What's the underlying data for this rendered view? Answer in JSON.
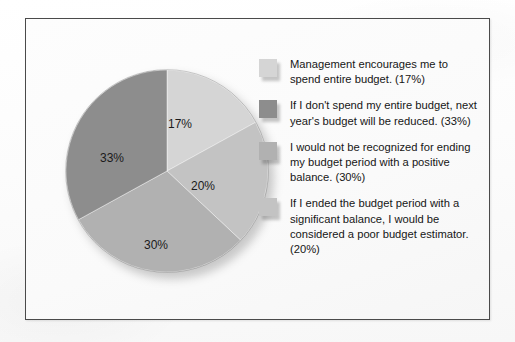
{
  "chart_data": {
    "type": "pie",
    "title": "",
    "subtitle": "",
    "xlabel": "",
    "ylabel": "",
    "legend_position": "right",
    "grid": false,
    "start_angle_deg": 0,
    "direction": "clockwise",
    "categories": [
      "Management encourages me to spend entire budget.",
      "If I don't spend my entire budget, next year's budget will be reduced.",
      "I would not be recognized for ending my budget period with a positive balance.",
      "If I ended the budget period with a significant balance, I would be considered a poor budget estimator."
    ],
    "values": [
      17,
      33,
      30,
      20
    ],
    "value_unit": "%",
    "slices": [
      {
        "label": "17%",
        "value": 17,
        "color": "#d5d5d5",
        "legend_index": 0,
        "start_angle_deg": 0,
        "end_angle_deg": 61.2,
        "label_x": 103,
        "label_y": 48
      },
      {
        "label": "20%",
        "value": 20,
        "color": "#c3c3c3",
        "legend_index": 3,
        "start_angle_deg": 61.2,
        "end_angle_deg": 133.2,
        "label_x": 126,
        "label_y": 110
      },
      {
        "label": "30%",
        "value": 30,
        "color": "#b1b1b1",
        "legend_index": 2,
        "start_angle_deg": 133.2,
        "end_angle_deg": 241.2,
        "label_x": 79,
        "label_y": 169
      },
      {
        "label": "33%",
        "value": 33,
        "color": "#8d8d8d",
        "legend_index": 1,
        "start_angle_deg": 241.2,
        "end_angle_deg": 360,
        "label_x": 35,
        "label_y": 82
      }
    ],
    "legend": [
      {
        "text": "Management encourages me to spend entire budget. (17%)",
        "percent": "17%",
        "color": "#d5d5d5"
      },
      {
        "text": "If I don't spend my entire budget, next year's budget will be reduced. (33%)",
        "percent": "33%",
        "color": "#8d8d8d"
      },
      {
        "text": "I would not be recognized for ending my budget period with a positive balance. (30%)",
        "percent": "30%",
        "color": "#b1b1b1"
      },
      {
        "text": "If I ended the budget period with a significant balance, I would be considered a poor budget estimator. (20%)",
        "percent": "20%",
        "color": "#c3c3c3"
      }
    ]
  },
  "colors": {
    "frame_border": "#4a4a4a",
    "page_background": "#fdfdfd",
    "label_text": "#1b1b1b",
    "legend_text": "#161616"
  }
}
